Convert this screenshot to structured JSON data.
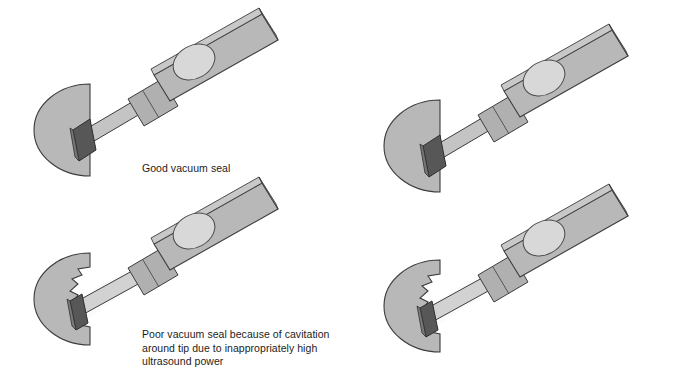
{
  "figure": {
    "background_color": "#ffffff",
    "width": 700,
    "height": 373
  },
  "colors": {
    "body_gray": "#b5b5b5",
    "body_gray_light": "#c2c2c2",
    "cone_gray": "#b8b8b8",
    "collar_gray": "#aeaeae",
    "shaft_gray": "#b0b0b0",
    "ellipse_light": "#d8d8d8",
    "tip_dark": "#535353",
    "tip_mid": "#6d6d6d",
    "sleeve_white": "#fbfbfb",
    "outline": "#3c3c3c",
    "text": "#1c1c1c"
  },
  "captions": {
    "good": "Good vacuum seal",
    "poor": "Poor vacuum seal because of cavitation\naround tip due to inappropriately high\nultrasound power"
  },
  "panels": [
    {
      "id": "top-left",
      "position": "top-left",
      "state": "good-seal",
      "caption_ref": "good",
      "description": "Phaco handpiece tip fully sealed against lens cone"
    },
    {
      "id": "top-right",
      "position": "top-right",
      "state": "good-seal",
      "caption_ref": null,
      "description": "Phaco handpiece tip fully sealed against lens cone"
    },
    {
      "id": "bottom-left",
      "position": "bottom-left",
      "state": "poor-seal-cavitation",
      "caption_ref": "poor",
      "description": "Phaco handpiece tip with cavitation gap around tip"
    },
    {
      "id": "bottom-right",
      "position": "bottom-right",
      "state": "poor-seal-cavitation",
      "caption_ref": null,
      "description": "Phaco handpiece tip with cavitation gap around tip"
    }
  ]
}
